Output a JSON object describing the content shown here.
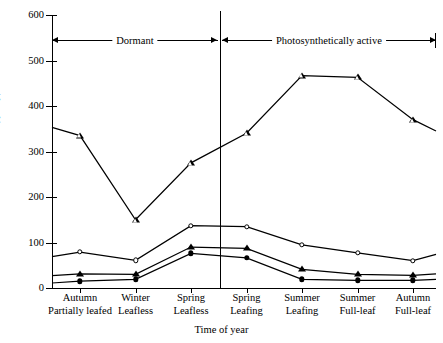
{
  "chart_data": {
    "type": "line",
    "title": "",
    "xlabel": "Time of year",
    "ylabel": "Radiation (ly/day)",
    "ylim": [
      0,
      600
    ],
    "yticks": [
      0,
      100,
      200,
      300,
      400,
      500,
      600
    ],
    "ytick_labels": [
      "0",
      "100",
      "200",
      "300",
      "400",
      "500",
      "600"
    ],
    "grid": false,
    "legend_position": "none",
    "categories": [
      "Autumn\nPartially leafed",
      "Winter\nLeafless",
      "Spring\nLeafless",
      "Spring\nLeafing",
      "Summer\nLeafing",
      "Summer\nFull-leaf",
      "Autumn\nFull-leaf"
    ],
    "category_lines": [
      [
        "Autumn",
        "Partially leafed"
      ],
      [
        "Winter",
        "Leafless"
      ],
      [
        "Spring",
        "Leafless"
      ],
      [
        "Spring",
        "Leafing"
      ],
      [
        "Summer",
        "Leafing"
      ],
      [
        "Summer",
        "Full-leaf"
      ],
      [
        "Autumn",
        "Full-leaf"
      ]
    ],
    "series": [
      {
        "name": "Above canopy (open triangle)",
        "marker": "triangle-open",
        "values": [
          335,
          150,
          275,
          340,
          467,
          463,
          370
        ],
        "start_value": 353,
        "end_value": 345
      },
      {
        "name": "Open circle series",
        "marker": "circle-open",
        "values": [
          79,
          61,
          137,
          135,
          95,
          77,
          60
        ],
        "start_value": 69,
        "end_value": 74
      },
      {
        "name": "Filled triangle series",
        "marker": "triangle-filled",
        "values": [
          31,
          30,
          90,
          87,
          41,
          30,
          28
        ],
        "start_value": 27,
        "end_value": 31
      },
      {
        "name": "Filled circle series",
        "marker": "circle-filled",
        "values": [
          15,
          19,
          76,
          66,
          19,
          17,
          17
        ],
        "start_value": 11,
        "end_value": 19
      }
    ],
    "annotations": [
      {
        "label": "Dormant",
        "span_start": 0,
        "span_end": 3
      },
      {
        "label": "Photosynthetically active",
        "span_start": 3,
        "span_end": 7
      }
    ],
    "divider_after_category": "Spring Leafless",
    "colors": {
      "line": "#000000",
      "background": "#ffffff"
    }
  }
}
